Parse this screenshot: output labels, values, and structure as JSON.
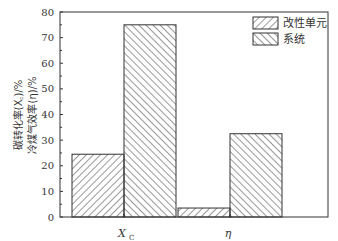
{
  "chart_data": {
    "type": "bar",
    "title": "",
    "xlabel": "",
    "ylabel": "碳转化率(X_C)/%  冷煤气效率(η)/%",
    "ylabel_lines": [
      "碳转化率(X",
      "冷煤气效率(η)/%"
    ],
    "ylabel_line1": "碳转化率(X_C)/%",
    "ylabel_line2": "冷煤气效率(η)/%",
    "categories": [
      "X_C",
      "η"
    ],
    "category_labels": [
      {
        "main": "X",
        "sub": "C"
      },
      {
        "main": "η",
        "sub": ""
      }
    ],
    "series": [
      {
        "name": "改性单元",
        "values": [
          24.5,
          3.5
        ],
        "hatch": "forward-diagonal"
      },
      {
        "name": "系统",
        "values": [
          75,
          32.5
        ],
        "hatch": "back-diagonal"
      }
    ],
    "ylim": [
      0,
      80
    ],
    "yticks": [
      0,
      10,
      20,
      30,
      40,
      50,
      60,
      70,
      80
    ],
    "grid": false,
    "legend_position": "top-right"
  },
  "legend": {
    "items": [
      "改性单元",
      "系统"
    ]
  },
  "axis": {
    "ytick_labels": [
      "0",
      "10",
      "20",
      "30",
      "40",
      "50",
      "60",
      "70",
      "80"
    ],
    "xtick_labels": [
      "X",
      "η"
    ],
    "xtick_sub": "C"
  }
}
